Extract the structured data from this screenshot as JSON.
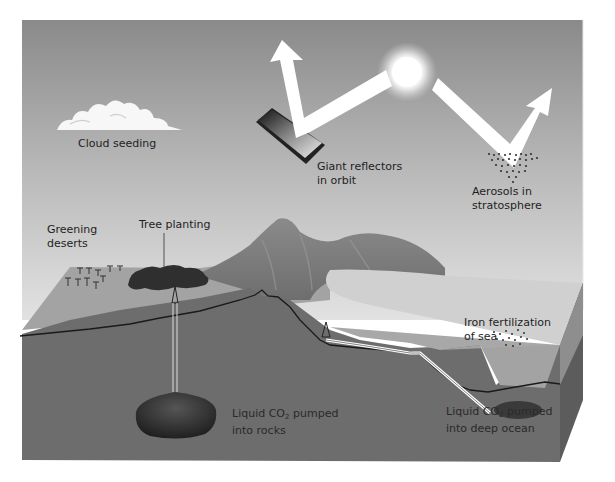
{
  "diagram": {
    "labels": {
      "cloud_seeding": "Cloud seeding",
      "reflectors_line1": "Giant reflectors",
      "reflectors_line2": "in orbit",
      "aerosols_line1": "Aerosols in",
      "aerosols_line2": "stratosphere",
      "greening_line1": "Greening",
      "greening_line2": "deserts",
      "tree_planting": "Tree planting",
      "iron_line1": "Iron fertilization",
      "iron_line2": "of sea",
      "co2_rocks_prefix": "Liquid CO",
      "co2_rocks_sub": "2",
      "co2_rocks_suffix": " pumped",
      "co2_rocks_line2": "into rocks",
      "co2_ocean_prefix": "Liquid CO",
      "co2_ocean_sub": "2",
      "co2_ocean_suffix": " pumped",
      "co2_ocean_line2": "into deep ocean"
    },
    "colors": {
      "sky_top": "#8c8c8c",
      "sky_bottom": "#dcdcdc",
      "ground_front": "#6e6e6e",
      "ground_top": "#9a9a9a",
      "sea_surface": "#cfcfcf",
      "sea_body": "#a8a8a8",
      "mountain": "#7d7d7d",
      "arrow": "#ffffff",
      "sun": "#ffffff",
      "reservoir": "#2e2e2e"
    }
  }
}
